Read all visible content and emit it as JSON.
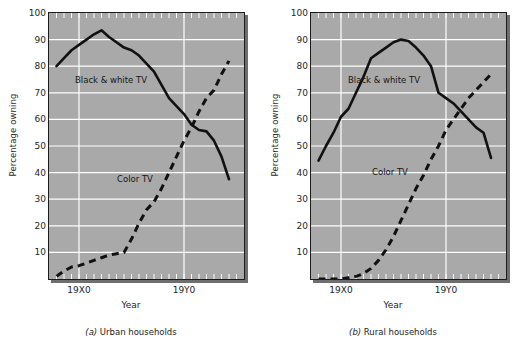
{
  "figure": {
    "background": "#ffffff",
    "plot_background": "#a9a9a9",
    "gridline_color": "#ffffff",
    "line_color": "#111111"
  },
  "panels": [
    {
      "id": "a",
      "caption_key": "(a)",
      "caption_text": "Urban households",
      "ylabel": "Percentage owning",
      "xlabel": "Year",
      "series_label_bw": "Black & white TV",
      "series_label_color": "Color TV"
    },
    {
      "id": "b",
      "caption_key": "(b)",
      "caption_text": "Rural households",
      "ylabel": "Percentage owning",
      "xlabel": "Year",
      "series_label_bw": "Black & white TV",
      "series_label_color": "Color TV"
    }
  ],
  "chart_data": [
    {
      "type": "line",
      "title": "(a) Urban households",
      "xlabel": "Year",
      "ylabel": "Percentage owning",
      "ylim": [
        0,
        100
      ],
      "yticks": [
        10,
        20,
        30,
        40,
        50,
        60,
        70,
        80,
        90,
        100
      ],
      "xlim": [
        0,
        26
      ],
      "xtick_labels": [
        "19X0",
        "19Y0"
      ],
      "xtick_positions": [
        4,
        18
      ],
      "grid": true,
      "legend": "inline-annotations",
      "series": [
        {
          "name": "Black & white TV",
          "style": "solid",
          "x": [
            1,
            2,
            3,
            4,
            5,
            6,
            7,
            8,
            9,
            10,
            11,
            12,
            13,
            14,
            15,
            16,
            17,
            18,
            19,
            20,
            21,
            22,
            23,
            24
          ],
          "values": [
            80,
            83,
            86,
            88,
            90,
            92,
            93.5,
            91,
            89,
            87,
            86,
            84,
            81,
            78,
            73,
            68,
            65,
            62,
            58,
            56,
            55.5,
            52,
            46,
            37.5
          ]
        },
        {
          "name": "Color TV",
          "style": "dashed",
          "x": [
            1,
            2,
            3,
            4,
            5,
            6,
            7,
            8,
            9,
            10,
            11,
            12,
            13,
            14,
            15,
            16,
            17,
            18,
            19,
            20,
            21,
            22,
            23,
            24
          ],
          "values": [
            1,
            3,
            4.5,
            5,
            6,
            7,
            8,
            9,
            9.5,
            10,
            15,
            21,
            26,
            29,
            34,
            40,
            46,
            52,
            57,
            63,
            68,
            71,
            77,
            82
          ]
        }
      ]
    },
    {
      "type": "line",
      "title": "(b) Rural households",
      "xlabel": "Year",
      "ylabel": "Percentage owning",
      "ylim": [
        0,
        100
      ],
      "yticks": [
        10,
        20,
        30,
        40,
        50,
        60,
        70,
        80,
        90,
        100
      ],
      "xlim": [
        0,
        26
      ],
      "xtick_labels": [
        "19X0",
        "19Y0"
      ],
      "xtick_positions": [
        4,
        18
      ],
      "grid": true,
      "legend": "inline-annotations",
      "series": [
        {
          "name": "Black & white TV",
          "style": "solid",
          "x": [
            1,
            2,
            3,
            4,
            5,
            6,
            7,
            8,
            9,
            10,
            11,
            12,
            13,
            14,
            15,
            16,
            17,
            18,
            19,
            20,
            21,
            22,
            23,
            24
          ],
          "values": [
            44.5,
            50,
            55,
            61,
            64,
            70,
            76,
            83,
            85,
            87,
            89,
            90,
            89.5,
            87,
            84,
            80,
            70,
            68,
            66,
            63,
            60,
            57,
            55,
            45.5
          ]
        },
        {
          "name": "Color TV",
          "style": "dashed",
          "x": [
            1,
            2,
            3,
            4,
            5,
            6,
            7,
            8,
            9,
            10,
            11,
            12,
            13,
            14,
            15,
            16,
            17,
            18,
            19,
            20,
            21,
            22,
            23,
            24
          ],
          "values": [
            0,
            0,
            0,
            0,
            0.5,
            1,
            2,
            4,
            7,
            11,
            16,
            22,
            28,
            34,
            39,
            45,
            50,
            56,
            60,
            64,
            68,
            71,
            74,
            77
          ]
        }
      ]
    }
  ]
}
